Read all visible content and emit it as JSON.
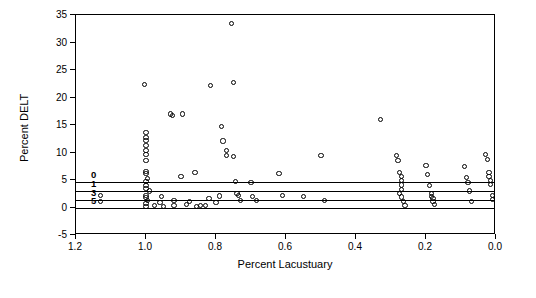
{
  "chart_data": {
    "type": "scatter",
    "title": "",
    "xlabel": "Percent Lacustuary",
    "ylabel": "Percent DELT",
    "xlim": [
      1.2,
      0.0
    ],
    "ylim": [
      -5,
      35
    ],
    "x_reversed": true,
    "xticks": [
      1.2,
      1.0,
      0.8,
      0.6,
      0.4,
      0.2,
      0.0
    ],
    "xticklabels": [
      "1.2",
      "1.0",
      "0.8",
      "0.6",
      "0.4",
      "0.2",
      "0.0"
    ],
    "yticks": [
      -5,
      0,
      5,
      10,
      15,
      20,
      25,
      30,
      35
    ],
    "yticklabels": [
      "-5",
      "0",
      "5",
      "10",
      "15",
      "20",
      "25",
      "30",
      "35"
    ],
    "grid": false,
    "legend": null,
    "marker": "open-circle",
    "reference_lines": [
      {
        "label": "0",
        "y": 4.6
      },
      {
        "label": "1",
        "y": 3.0
      },
      {
        "label": "3",
        "y": 1.3
      },
      {
        "label": "5",
        "y": 0.0
      }
    ],
    "points": [
      {
        "x": 1.13,
        "y": 2.2
      },
      {
        "x": 1.13,
        "y": 1.1
      },
      {
        "x": 1.005,
        "y": 22.3
      },
      {
        "x": 1.0,
        "y": 13.6
      },
      {
        "x": 1.0,
        "y": 12.8
      },
      {
        "x": 1.0,
        "y": 12.2
      },
      {
        "x": 1.0,
        "y": 11.3
      },
      {
        "x": 1.0,
        "y": 10.4
      },
      {
        "x": 1.0,
        "y": 9.6
      },
      {
        "x": 1.0,
        "y": 8.5
      },
      {
        "x": 1.0,
        "y": 6.6
      },
      {
        "x": 1.0,
        "y": 6.2
      },
      {
        "x": 0.995,
        "y": 5.2
      },
      {
        "x": 1.0,
        "y": 4.8
      },
      {
        "x": 1.0,
        "y": 4.0
      },
      {
        "x": 1.0,
        "y": 3.4
      },
      {
        "x": 0.99,
        "y": 3.0
      },
      {
        "x": 1.0,
        "y": 2.2
      },
      {
        "x": 1.0,
        "y": 1.8
      },
      {
        "x": 0.995,
        "y": 1.2
      },
      {
        "x": 1.0,
        "y": 0.8
      },
      {
        "x": 1.0,
        "y": 0.2
      },
      {
        "x": 0.975,
        "y": 0.3
      },
      {
        "x": 0.96,
        "y": 0.9
      },
      {
        "x": 0.955,
        "y": 2.0
      },
      {
        "x": 0.95,
        "y": 0.2
      },
      {
        "x": 0.93,
        "y": 17.0
      },
      {
        "x": 0.925,
        "y": 16.8
      },
      {
        "x": 0.92,
        "y": 1.2
      },
      {
        "x": 0.92,
        "y": 0.3
      },
      {
        "x": 0.9,
        "y": 5.6
      },
      {
        "x": 0.895,
        "y": 17.0
      },
      {
        "x": 0.885,
        "y": 0.5
      },
      {
        "x": 0.875,
        "y": 1.1
      },
      {
        "x": 0.86,
        "y": 6.3
      },
      {
        "x": 0.855,
        "y": 0.2
      },
      {
        "x": 0.845,
        "y": 0.4
      },
      {
        "x": 0.83,
        "y": 0.3
      },
      {
        "x": 0.82,
        "y": 1.7
      },
      {
        "x": 0.815,
        "y": 22.2
      },
      {
        "x": 0.8,
        "y": 0.9
      },
      {
        "x": 0.79,
        "y": 2.1
      },
      {
        "x": 0.785,
        "y": 14.8
      },
      {
        "x": 0.78,
        "y": 12.1
      },
      {
        "x": 0.77,
        "y": 10.4
      },
      {
        "x": 0.77,
        "y": 9.4
      },
      {
        "x": 0.755,
        "y": 33.4
      },
      {
        "x": 0.75,
        "y": 22.7
      },
      {
        "x": 0.75,
        "y": 9.3
      },
      {
        "x": 0.745,
        "y": 4.8
      },
      {
        "x": 0.74,
        "y": 2.6
      },
      {
        "x": 0.735,
        "y": 2.2
      },
      {
        "x": 0.73,
        "y": 1.3
      },
      {
        "x": 0.7,
        "y": 4.6
      },
      {
        "x": 0.695,
        "y": 2.0
      },
      {
        "x": 0.685,
        "y": 1.2
      },
      {
        "x": 0.62,
        "y": 6.2
      },
      {
        "x": 0.61,
        "y": 2.2
      },
      {
        "x": 0.55,
        "y": 2.0
      },
      {
        "x": 0.5,
        "y": 9.4
      },
      {
        "x": 0.49,
        "y": 1.2
      },
      {
        "x": 0.33,
        "y": 16.0
      },
      {
        "x": 0.285,
        "y": 9.5
      },
      {
        "x": 0.28,
        "y": 8.6
      },
      {
        "x": 0.275,
        "y": 6.3
      },
      {
        "x": 0.27,
        "y": 5.7
      },
      {
        "x": 0.27,
        "y": 4.9
      },
      {
        "x": 0.27,
        "y": 4.1
      },
      {
        "x": 0.27,
        "y": 3.2
      },
      {
        "x": 0.275,
        "y": 2.6
      },
      {
        "x": 0.27,
        "y": 1.9
      },
      {
        "x": 0.265,
        "y": 1.1
      },
      {
        "x": 0.26,
        "y": 0.4
      },
      {
        "x": 0.2,
        "y": 7.6
      },
      {
        "x": 0.195,
        "y": 6.0
      },
      {
        "x": 0.19,
        "y": 4.0
      },
      {
        "x": 0.185,
        "y": 2.6
      },
      {
        "x": 0.185,
        "y": 2.0
      },
      {
        "x": 0.18,
        "y": 1.6
      },
      {
        "x": 0.18,
        "y": 1.1
      },
      {
        "x": 0.175,
        "y": 0.6
      },
      {
        "x": 0.09,
        "y": 7.5
      },
      {
        "x": 0.085,
        "y": 5.4
      },
      {
        "x": 0.08,
        "y": 4.6
      },
      {
        "x": 0.075,
        "y": 3.0
      },
      {
        "x": 0.07,
        "y": 1.1
      },
      {
        "x": 0.03,
        "y": 9.6
      },
      {
        "x": 0.025,
        "y": 8.7
      },
      {
        "x": 0.02,
        "y": 6.3
      },
      {
        "x": 0.02,
        "y": 5.6
      },
      {
        "x": 0.015,
        "y": 4.9
      },
      {
        "x": 0.015,
        "y": 4.2
      },
      {
        "x": 0.01,
        "y": 2.2
      },
      {
        "x": 0.01,
        "y": 1.4
      }
    ]
  }
}
